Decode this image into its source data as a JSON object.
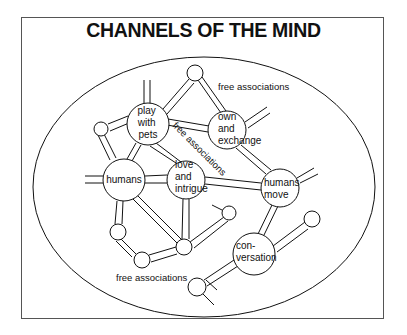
{
  "title": "CHANNELS OF THE MIND",
  "nodes": {
    "play_with_pets": [
      "play",
      "with",
      "pets"
    ],
    "own_and_exchange": [
      "own",
      "and",
      "exchange"
    ],
    "humans": [
      "humans"
    ],
    "love_and_intrigue": [
      "love",
      "and",
      "intrigue"
    ],
    "humans_move": [
      "humans",
      "move"
    ],
    "conversation": [
      "con-",
      "versation"
    ]
  },
  "annotations": {
    "top_right": "free associations",
    "diagonal": "free associations",
    "bottom_left": "free associations"
  },
  "colors": {
    "stroke": "#111111",
    "background": "#ffffff",
    "frame": "#555555"
  }
}
